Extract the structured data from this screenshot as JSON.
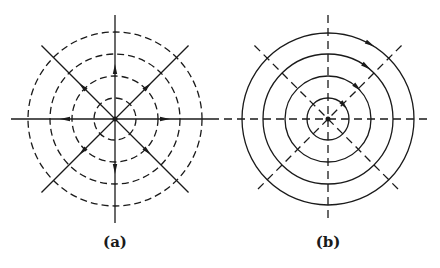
{
  "figure": {
    "panels": [
      {
        "id": "a",
        "label": "(a)",
        "center": [
          115,
          119
        ],
        "radii": [
          21,
          43,
          65,
          87
        ],
        "circle_style": "dashed",
        "ray_style": "solid",
        "ray_length": 104,
        "arrow_type": "radial-outward",
        "arrow_radius": 46
      },
      {
        "id": "b",
        "label": "(b)",
        "center": [
          328,
          119
        ],
        "radii": [
          21,
          43,
          65,
          86
        ],
        "circle_style": "solid",
        "ray_style": "dashed",
        "ray_length": 104,
        "arrow_type": "tangential-clockwise",
        "arrow_angle_deg": -40
      }
    ],
    "stroke_color": "#1a1a1a",
    "background": "#ffffff"
  }
}
